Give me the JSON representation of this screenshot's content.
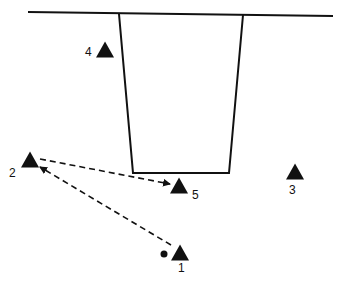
{
  "diagram": {
    "colors": {
      "ink": "#111111",
      "background": "#ffffff"
    },
    "ground_line": {
      "x1": 28,
      "y1": 12,
      "x2": 333,
      "y2": 16
    },
    "trench": {
      "points": "119,14 133,173 229,173 243,15"
    },
    "stations": [
      {
        "id": "1",
        "label": "1",
        "cx": 180,
        "cy": 253,
        "label_x": 178,
        "label_y": 272
      },
      {
        "id": "2",
        "label": "2",
        "cx": 30,
        "cy": 160,
        "label_x": 9,
        "label_y": 177
      },
      {
        "id": "3",
        "label": "3",
        "cx": 295,
        "cy": 172,
        "label_x": 289,
        "label_y": 194
      },
      {
        "id": "4",
        "label": "4",
        "cx": 105,
        "cy": 50,
        "label_x": 85,
        "label_y": 56
      },
      {
        "id": "5",
        "label": "5",
        "cx": 179,
        "cy": 186,
        "label_x": 192,
        "label_y": 199
      }
    ],
    "origin_dot": {
      "cx": 164,
      "cy": 254,
      "r": 3.5
    },
    "arrows": [
      {
        "from": "2",
        "to": "5",
        "x1": 40,
        "y1": 159,
        "x2": 170,
        "y2": 184,
        "style": "dashed"
      },
      {
        "from": "1",
        "to": "2",
        "x1": 171,
        "y1": 245,
        "x2": 40,
        "y2": 167,
        "style": "dashed"
      }
    ]
  }
}
